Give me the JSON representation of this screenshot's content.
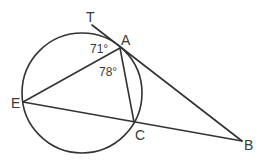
{
  "diagram": {
    "type": "geometry-circle-tangent-secant",
    "colors": {
      "line": "#333333",
      "text": "#3a3a3a",
      "background": "#ffffff"
    },
    "circle": {
      "cx": 82,
      "cy": 93,
      "r": 60
    },
    "points": {
      "T": {
        "label": "T",
        "x": 92,
        "y": 25
      },
      "A": {
        "label": "A",
        "x": 120,
        "y": 48
      },
      "E": {
        "label": "E",
        "x": 23,
        "y": 102
      },
      "C": {
        "label": "C",
        "x": 134,
        "y": 122
      },
      "B": {
        "label": "B",
        "x": 242,
        "y": 141
      }
    },
    "segments": [
      {
        "from": "T",
        "to": "B",
        "role": "tangent line TA extended to B"
      },
      {
        "from": "A",
        "to": "E",
        "role": "chord AE"
      },
      {
        "from": "A",
        "to": "C",
        "role": "chord AC"
      },
      {
        "from": "E",
        "to": "B",
        "role": "secant EB through C"
      }
    ],
    "angles": [
      {
        "label": "71°",
        "value": 71,
        "between": "TA and AE",
        "vertex": "A"
      },
      {
        "label": "78°",
        "value": 78,
        "between": "EA and AC",
        "vertex": "A"
      }
    ]
  }
}
